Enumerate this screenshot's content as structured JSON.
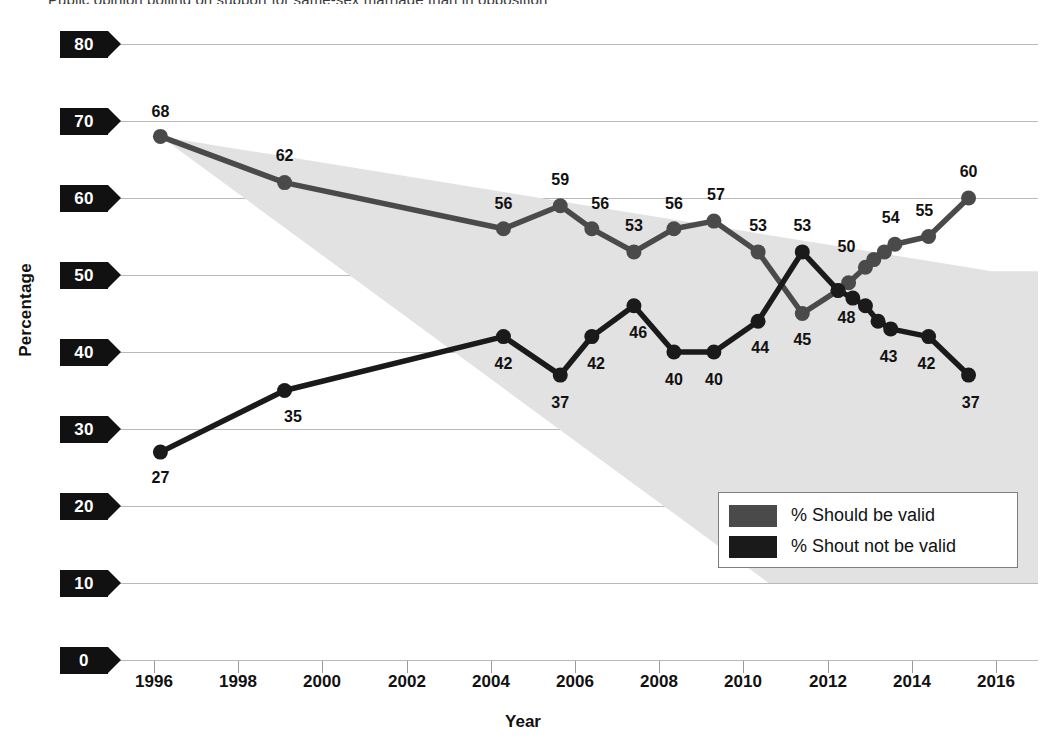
{
  "chart_data": {
    "type": "line",
    "title": "Public opinion polling on support for same-sex marriage than in opposition",
    "xlabel": "Year",
    "ylabel": "Percentage",
    "xlim": [
      1995.0,
      2017.0
    ],
    "ylim": [
      0,
      80
    ],
    "yticks": [
      0,
      10,
      20,
      30,
      40,
      50,
      60,
      70,
      80
    ],
    "xticks": [
      1996,
      1998,
      2000,
      2002,
      2004,
      2006,
      2008,
      2010,
      2012,
      2014,
      2016
    ],
    "grid": true,
    "legend_position": "inside-bottom-right",
    "colors": {
      "should_be_valid": "#4a4a4a",
      "should_not_be_valid": "#1a1a1a",
      "gridline": "#b9b9b9",
      "band_fill": "#e2e2e2",
      "badge_bg": "#111111",
      "badge_text": "#ffffff"
    },
    "series": [
      {
        "name": "% Should be valid",
        "color": "#4a4a4a",
        "points": [
          {
            "x": 1996.15,
            "y": 68,
            "label": "68",
            "lx": 1996.15,
            "ly": 71.2
          },
          {
            "x": 1999.1,
            "y": 62,
            "label": "62",
            "lx": 1999.1,
            "ly": 65.4
          },
          {
            "x": 2004.3,
            "y": 56,
            "label": "56",
            "lx": 2004.3,
            "ly": 59.2
          },
          {
            "x": 2005.65,
            "y": 59,
            "label": "59",
            "lx": 2005.65,
            "ly": 62.4
          },
          {
            "x": 2006.4,
            "y": 56,
            "label": "56",
            "lx": 2006.6,
            "ly": 59.2
          },
          {
            "x": 2007.4,
            "y": 53,
            "label": "53",
            "lx": 2007.4,
            "ly": 56.3
          },
          {
            "x": 2008.35,
            "y": 56,
            "label": "56",
            "lx": 2008.35,
            "ly": 59.2
          },
          {
            "x": 2009.3,
            "y": 57,
            "label": "57",
            "lx": 2009.35,
            "ly": 60.4
          },
          {
            "x": 2010.35,
            "y": 53,
            "label": "53",
            "lx": 2010.35,
            "ly": 56.3
          },
          {
            "x": 2011.4,
            "y": 45,
            "label": "45",
            "lx": 2011.4,
            "ly": 41.6
          },
          {
            "x": 2012.25,
            "y": 48,
            "label": "",
            "lx": 0,
            "ly": 0
          },
          {
            "x": 2012.5,
            "y": 49,
            "label": "",
            "lx": 0,
            "ly": 0
          },
          {
            "x": 2012.9,
            "y": 51,
            "label": "50",
            "lx": 2012.45,
            "ly": 53.6
          },
          {
            "x": 2013.1,
            "y": 52,
            "label": "",
            "lx": 0,
            "ly": 0
          },
          {
            "x": 2013.35,
            "y": 53,
            "label": "",
            "lx": 0,
            "ly": 0
          },
          {
            "x": 2013.6,
            "y": 54,
            "label": "54",
            "lx": 2013.5,
            "ly": 57.4
          },
          {
            "x": 2014.4,
            "y": 55,
            "label": "55",
            "lx": 2014.3,
            "ly": 58.3
          },
          {
            "x": 2015.35,
            "y": 60,
            "label": "60",
            "lx": 2015.35,
            "ly": 63.4
          }
        ]
      },
      {
        "name": "% Shout not be valid",
        "color": "#1a1a1a",
        "points": [
          {
            "x": 1996.15,
            "y": 27,
            "label": "27",
            "lx": 1996.15,
            "ly": 23.6
          },
          {
            "x": 1999.1,
            "y": 35,
            "label": "35",
            "lx": 1999.3,
            "ly": 31.6
          },
          {
            "x": 2004.3,
            "y": 42,
            "label": "42",
            "lx": 2004.3,
            "ly": 38.5
          },
          {
            "x": 2005.65,
            "y": 37,
            "label": "37",
            "lx": 2005.65,
            "ly": 33.4
          },
          {
            "x": 2006.4,
            "y": 42,
            "label": "42",
            "lx": 2006.5,
            "ly": 38.5
          },
          {
            "x": 2007.4,
            "y": 46,
            "label": "46",
            "lx": 2007.5,
            "ly": 42.5
          },
          {
            "x": 2008.35,
            "y": 40,
            "label": "40",
            "lx": 2008.35,
            "ly": 36.4
          },
          {
            "x": 2009.3,
            "y": 40,
            "label": "40",
            "lx": 2009.3,
            "ly": 36.4
          },
          {
            "x": 2010.35,
            "y": 44,
            "label": "44",
            "lx": 2010.4,
            "ly": 40.5
          },
          {
            "x": 2011.4,
            "y": 53,
            "label": "53",
            "lx": 2011.4,
            "ly": 56.4
          },
          {
            "x": 2012.25,
            "y": 48,
            "label": "48",
            "lx": 2012.45,
            "ly": 44.4
          },
          {
            "x": 2012.6,
            "y": 47,
            "label": "",
            "lx": 0,
            "ly": 0
          },
          {
            "x": 2012.9,
            "y": 46,
            "label": "",
            "lx": 0,
            "ly": 0
          },
          {
            "x": 2013.2,
            "y": 44,
            "label": "",
            "lx": 0,
            "ly": 0
          },
          {
            "x": 2013.5,
            "y": 43,
            "label": "43",
            "lx": 2013.45,
            "ly": 39.4
          },
          {
            "x": 2014.4,
            "y": 42,
            "label": "42",
            "lx": 2014.35,
            "ly": 38.4
          },
          {
            "x": 2015.35,
            "y": 37,
            "label": "37",
            "lx": 2015.4,
            "ly": 33.4
          }
        ]
      }
    ],
    "band": {
      "note": "light grey wedge between the two trend lines",
      "fill": "#e2e2e2",
      "upper": [
        [
          1996.15,
          68
        ],
        [
          2015.9,
          50.5
        ],
        [
          2017.0,
          50.5
        ]
      ],
      "lower": [
        [
          1996.15,
          68
        ],
        [
          2010.6,
          10.0
        ],
        [
          2017.0,
          10.0
        ]
      ]
    }
  },
  "legend": {
    "items": [
      {
        "label": "% Should be valid",
        "color": "#4a4a4a"
      },
      {
        "label": "% Shout not be valid",
        "color": "#1a1a1a"
      }
    ]
  },
  "axes": {
    "y_title": "Percentage",
    "x_title": "Year",
    "y_ticks": [
      "80",
      "70",
      "60",
      "50",
      "40",
      "30",
      "20",
      "10",
      "0"
    ],
    "x_ticks": [
      "1996",
      "1998",
      "2000",
      "2002",
      "2004",
      "2006",
      "2008",
      "2010",
      "2012",
      "2014",
      "2016"
    ]
  }
}
